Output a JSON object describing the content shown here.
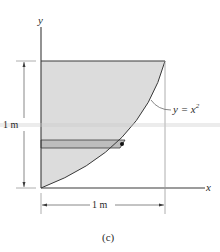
{
  "figure": {
    "caption": "(c)",
    "axes": {
      "x_label": "x",
      "y_label": "y"
    },
    "curve": {
      "equation_label": "y = x",
      "equation_lhs": "y = x",
      "equation_exponent": "2"
    },
    "dimensions": {
      "vertical": "1 m",
      "horizontal": "1 m"
    },
    "colors": {
      "region_fill": "#dcdcdc",
      "strip_fill": "#bdbdbd",
      "line": "#3a3a3a",
      "guide": "#9a9a9a",
      "scan_band": "#c8c8c8"
    },
    "elements": {
      "shaded_region": "area between y-axis, line y=1 and curve y=x^2",
      "horizontal_strip": "differential element",
      "strip_point": "point on curve"
    }
  }
}
